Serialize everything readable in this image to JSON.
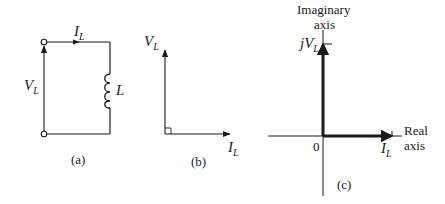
{
  "colors": {
    "ink": "#1a1a1a",
    "background": "#ffffff"
  },
  "panel_a": {
    "caption": "(a)",
    "current_label": {
      "main": "I",
      "sub": "L"
    },
    "voltage_label": {
      "main": "V",
      "sub": "L"
    },
    "inductor_label": "L",
    "components": [
      "terminal-top",
      "terminal-bottom",
      "inductor",
      "current-arrow",
      "voltage-arrow"
    ]
  },
  "panel_b": {
    "caption": "(b)",
    "voltage_label": {
      "main": "V",
      "sub": "L"
    },
    "current_label": {
      "main": "I",
      "sub": "L"
    },
    "angle_marker": "right-angle"
  },
  "panel_c": {
    "caption": "(c)",
    "vertical_axis_label_line1": "Imaginary",
    "vertical_axis_label_line2": "axis",
    "horizontal_axis_label_line1": "Real",
    "horizontal_axis_label_line2": "axis",
    "origin_label": "0",
    "imag_phasor_label": {
      "prefix": "j",
      "main": "V",
      "sub": "L"
    },
    "real_phasor_label": {
      "main": "I",
      "sub": "L"
    }
  }
}
